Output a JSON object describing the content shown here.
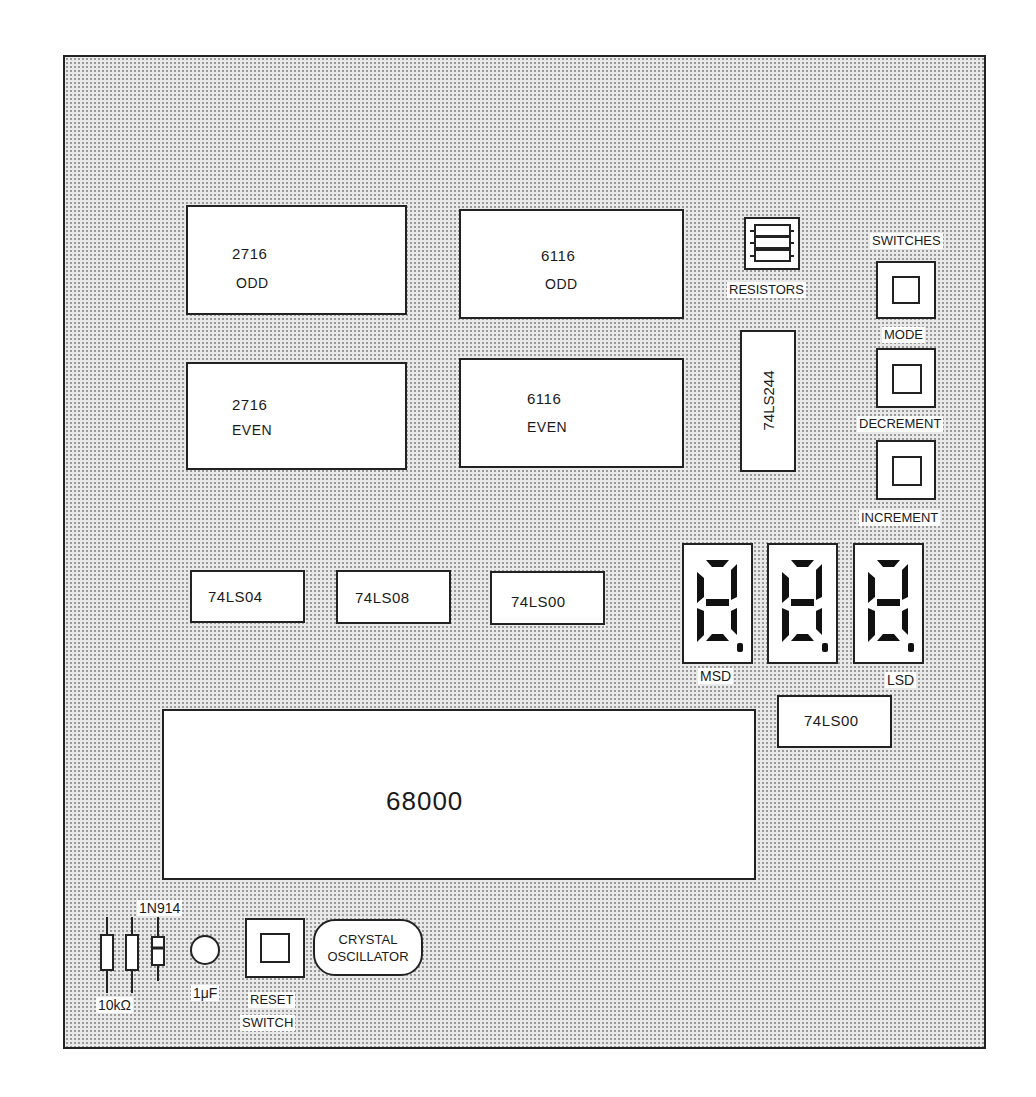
{
  "board": {
    "memory": {
      "eprom_odd": {
        "part": "2716",
        "bank": "ODD"
      },
      "eprom_even": {
        "part": "2716",
        "bank": "EVEN"
      },
      "ram_odd": {
        "part": "6116",
        "bank": "ODD"
      },
      "ram_even": {
        "part": "6116",
        "bank": "EVEN"
      }
    },
    "resistors_label": "RESISTORS",
    "buffer_chip": "74LS244",
    "switches": {
      "title": "SWITCHES",
      "items": [
        {
          "label": "MODE"
        },
        {
          "label": "DECREMENT"
        },
        {
          "label": "INCREMENT"
        }
      ]
    },
    "logic_chips": [
      "74LS04",
      "74LS08",
      "74LS00"
    ],
    "display": {
      "digits": 3,
      "msd_label": "MSD",
      "lsd_label": "LSD"
    },
    "display_driver_chip": "74LS00",
    "cpu": "68000",
    "bottom": {
      "diode_label": "1N914",
      "resistor_value": "10kΩ",
      "capacitor_value": "1μF",
      "reset_label_1": "RESET",
      "reset_label_2": "SWITCH",
      "oscillator_label_1": "CRYSTAL",
      "oscillator_label_2": "OSCILLATOR"
    }
  }
}
